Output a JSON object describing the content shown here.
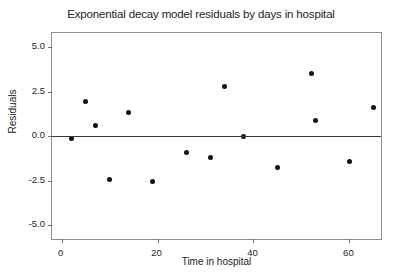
{
  "chart_data": {
    "type": "scatter",
    "title": "Exponential decay model residuals by days in hospital",
    "xlabel": "Time in hospital",
    "ylabel": "Residuals",
    "xlim": [
      -2,
      67
    ],
    "ylim": [
      -5.9,
      5.8
    ],
    "xticks": [
      0,
      20,
      40,
      60
    ],
    "xtick_labels": [
      "0",
      "20",
      "40",
      "60"
    ],
    "yticks": [
      5.0,
      2.5,
      0.0,
      -2.5,
      -5.0
    ],
    "ytick_labels": [
      "5.0",
      "2.5",
      "0.0",
      "-2.5",
      "-5.0"
    ],
    "grid": false,
    "legend": null,
    "reference_lines": [
      {
        "orientation": "horizontal",
        "y": 0.0,
        "color": "#3a3a3a"
      }
    ],
    "marker": {
      "shape": "circle",
      "color": "#111111",
      "size": 5
    },
    "points": [
      {
        "x": 2,
        "y": -0.15
      },
      {
        "x": 5,
        "y": 1.95
      },
      {
        "x": 7,
        "y": 0.6
      },
      {
        "x": 10,
        "y": -2.45
      },
      {
        "x": 14,
        "y": 1.35
      },
      {
        "x": 19,
        "y": -2.55
      },
      {
        "x": 26,
        "y": -0.9
      },
      {
        "x": 31,
        "y": -1.2
      },
      {
        "x": 34,
        "y": 2.8
      },
      {
        "x": 38,
        "y": 0.0
      },
      {
        "x": 45,
        "y": -1.75
      },
      {
        "x": 52,
        "y": 3.55
      },
      {
        "x": 53,
        "y": 0.9
      },
      {
        "x": 60,
        "y": -1.45
      },
      {
        "x": 65,
        "y": 1.6
      }
    ]
  }
}
